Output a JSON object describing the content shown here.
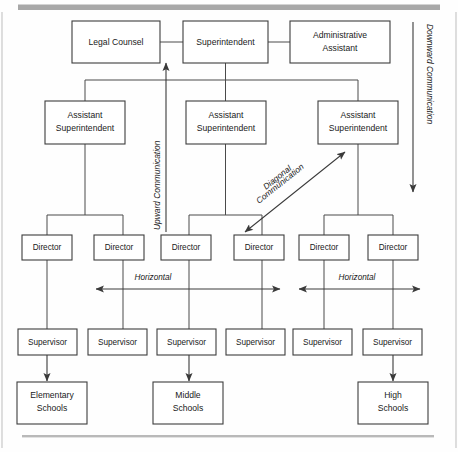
{
  "diagram": {
    "top_rule_color": "#a8a8a8",
    "bottom_rule_color": "#b9b9b9",
    "box_stroke_color": "#3d3d3d",
    "line_color": "#4a4a4a",
    "text_color": "#1a1a1a",
    "level_1": [
      {
        "id": "legal-counsel",
        "label": "Legal Counsel",
        "lines": [
          "Legal Counsel"
        ]
      },
      {
        "id": "superintendent",
        "label": "Superintendent",
        "lines": [
          "Superintendent"
        ]
      },
      {
        "id": "administrative-assistant",
        "label": "Administrative Assistant",
        "lines": [
          "Administrative",
          "Assistant"
        ]
      }
    ],
    "level_2": [
      {
        "id": "assistant-superintendent-1",
        "label": "Assistant Superintendent",
        "lines": [
          "Assistant",
          "Superintendent"
        ]
      },
      {
        "id": "assistant-superintendent-2",
        "label": "Assistant Superintendent",
        "lines": [
          "Assistant",
          "Superintendent"
        ]
      },
      {
        "id": "assistant-superintendent-3",
        "label": "Assistant Superintendent",
        "lines": [
          "Assistant",
          "Superintendent"
        ]
      }
    ],
    "level_3": [
      {
        "id": "director-1",
        "label": "Director"
      },
      {
        "id": "director-2",
        "label": "Director"
      },
      {
        "id": "director-3",
        "label": "Director"
      },
      {
        "id": "director-4",
        "label": "Director"
      },
      {
        "id": "director-5",
        "label": "Director"
      },
      {
        "id": "director-6",
        "label": "Director"
      }
    ],
    "level_4": [
      {
        "id": "supervisor-1",
        "label": "Supervisor"
      },
      {
        "id": "supervisor-2",
        "label": "Supervisor"
      },
      {
        "id": "supervisor-3",
        "label": "Supervisor"
      },
      {
        "id": "supervisor-4",
        "label": "Supervisor"
      },
      {
        "id": "supervisor-5",
        "label": "Supervisor"
      },
      {
        "id": "supervisor-6",
        "label": "Supervisor"
      }
    ],
    "level_5": [
      {
        "id": "elementary-schools",
        "label": "Elementary Schools",
        "lines": [
          "Elementary",
          "Schools"
        ]
      },
      {
        "id": "middle-schools",
        "label": "Middle Schools",
        "lines": [
          "Middle",
          "Schools"
        ]
      },
      {
        "id": "high-schools",
        "label": "High Schools",
        "lines": [
          "High",
          "Schools"
        ]
      }
    ],
    "flows": {
      "downward": "Downward Communication",
      "upward": "Upward Communication",
      "diagonal_line_1": "Diagonal",
      "diagonal_line_2": "Communication",
      "horizontal_left": "Horizontal",
      "horizontal_right": "Horizontal"
    }
  }
}
